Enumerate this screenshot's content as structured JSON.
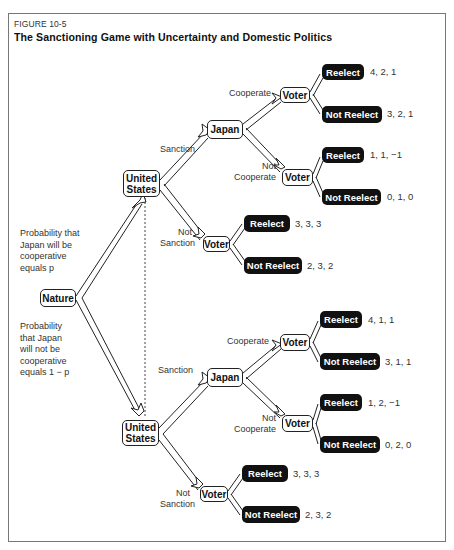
{
  "figure": {
    "label": "FIGURE 10-5",
    "title": "The Sanctioning Game with Uncertainty and Domestic Politics"
  },
  "root": {
    "node": "Nature",
    "prob_upper": [
      "Probability that",
      "Japan will be",
      "cooperative",
      "equals p"
    ],
    "prob_lower": [
      "Probability",
      "that Japan",
      "will not be",
      "cooperative",
      "equals 1 − p"
    ]
  },
  "upper": {
    "us_node": [
      "United",
      "States"
    ],
    "sanction_label": "Sanction",
    "not_sanction_label": [
      "Not",
      "Sanction"
    ],
    "japan_node": "Japan",
    "cooperate_label": "Cooperate",
    "not_cooperate_label": [
      "Not",
      "Cooperate"
    ],
    "voter_label": "Voter",
    "outcomes": [
      {
        "branch": "Sanction / Cooperate",
        "reelect": "Reelect",
        "reelect_payoff": "4, 2, 1",
        "not_reelect": "Not Reelect",
        "not_reelect_payoff": "3, 2, 1"
      },
      {
        "branch": "Sanction / Not Cooperate",
        "reelect": "Reelect",
        "reelect_payoff": "1, 1, −1",
        "not_reelect": "Not Reelect",
        "not_reelect_payoff": "0, 1, 0"
      },
      {
        "branch": "Not Sanction",
        "reelect": "Reelect",
        "reelect_payoff": "3, 3, 3",
        "not_reelect": "Not Reelect",
        "not_reelect_payoff": "2, 3, 2"
      }
    ]
  },
  "lower": {
    "us_node": [
      "United",
      "States"
    ],
    "sanction_label": "Sanction",
    "not_sanction_label": [
      "Not",
      "Sanction"
    ],
    "japan_node": "Japan",
    "cooperate_label": "Cooperate",
    "not_cooperate_label": [
      "Not",
      "Cooperate"
    ],
    "voter_label": "Voter",
    "outcomes": [
      {
        "branch": "Sanction / Cooperate",
        "reelect": "Reelect",
        "reelect_payoff": "4, 1, 1",
        "not_reelect": "Not Reelect",
        "not_reelect_payoff": "3, 1, 1"
      },
      {
        "branch": "Sanction / Not Cooperate",
        "reelect": "Reelect",
        "reelect_payoff": "1, 2, −1",
        "not_reelect": "Not Reelect",
        "not_reelect_payoff": "0, 2, 0"
      },
      {
        "branch": "Not Sanction",
        "reelect": "Reelect",
        "reelect_payoff": "3, 3, 3",
        "not_reelect": "Not Reelect",
        "not_reelect_payoff": "2, 3, 2"
      }
    ]
  },
  "colors": {
    "terminal_bg": "#111111",
    "terminal_text": "#ffffff",
    "border": "#222222",
    "frame": "#777777"
  }
}
